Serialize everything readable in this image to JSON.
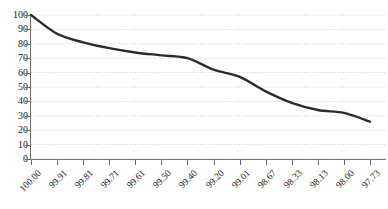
{
  "chart_data": {
    "type": "line",
    "title": "",
    "subtitle": "",
    "xlabel": "",
    "ylabel": "",
    "categories": [
      "100.00",
      "99.91",
      "99.81",
      "99.71",
      "99.61",
      "99.50",
      "99.40",
      "99.20",
      "99.01",
      "98.67",
      "98.33",
      "98.13",
      "98.00",
      "97.73"
    ],
    "values": [
      100,
      87,
      81,
      77,
      74,
      72,
      70,
      62,
      57,
      47,
      39,
      34,
      32,
      26
    ],
    "series": [
      {
        "name": "cumulative-curve",
        "values": [
          100,
          87,
          81,
          77,
          74,
          72,
          70,
          62,
          57,
          47,
          39,
          34,
          32,
          26
        ]
      }
    ],
    "ylim": [
      0,
      100
    ],
    "y_ticks": [
      0,
      10,
      20,
      30,
      40,
      50,
      60,
      70,
      80,
      90,
      100
    ],
    "y_tick_labels": [
      "0",
      "10",
      "20",
      "30",
      "40",
      "50",
      "60",
      "70",
      "80",
      "90",
      "100"
    ],
    "x_tick_labels": [
      "100.00",
      "99.91",
      "99.81",
      "99.71",
      "99.61",
      "99.50",
      "99.40",
      "99.20",
      "99.01",
      "98.67",
      "98.33",
      "98.13",
      "98.00",
      "97.73"
    ],
    "grid": true,
    "grid_orientation": "horizontal",
    "grid_style": "dotted",
    "legend": false,
    "legend_position": "none",
    "annotations": [],
    "colors": {
      "line": "#2b2b2b",
      "grid": "#bfbfbf",
      "axis": "#6b6b6b",
      "text": "#1a1a1a",
      "background": "#ffffff"
    },
    "line_width": 2.4
  }
}
